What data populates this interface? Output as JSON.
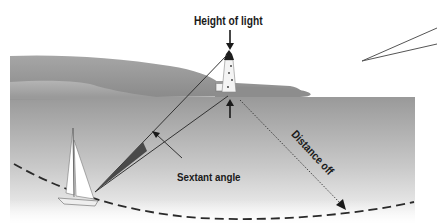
{
  "diagram": {
    "type": "nautical distance-off by vertical sextant angle",
    "labels": {
      "height_of_light": "Height of light",
      "distance_off": "Distance off",
      "sextant_angle": "Sextant angle"
    },
    "cropped_header_text": "",
    "elements": [
      {
        "name": "lighthouse",
        "desc": "white lighthouse tower with black lantern top on shoreline"
      },
      {
        "name": "sailboat",
        "desc": "white sloop in lower left foreground"
      },
      {
        "name": "coastline",
        "desc": "grey layered hills behind lighthouse"
      },
      {
        "name": "sea",
        "desc": "grey gradient water fading to white toward bottom"
      },
      {
        "name": "range-arc",
        "desc": "dashed arc of constant distance passing through the yacht"
      },
      {
        "name": "sight-lines",
        "desc": "two lines from yacht to lighthouse top and base forming sextant angle"
      },
      {
        "name": "angle-wedge",
        "desc": "dark filled wedge near yacht marking the angle"
      },
      {
        "name": "distance-arrow",
        "desc": "dotted arrow from lighthouse base to dashed arc"
      },
      {
        "name": "inset-pointer",
        "desc": "narrow V-shaped callout lines at upper right"
      }
    ],
    "colors": {
      "sky": "#ffffff",
      "hill_dark": "#8f8f8f",
      "hill_light": "#a8a8a8",
      "sea_top": "#9c9c9c",
      "sea_bottom": "#f6f6f6",
      "wedge": "#4a4a4a",
      "line": "#333333",
      "text": "#1a1a1a"
    }
  }
}
